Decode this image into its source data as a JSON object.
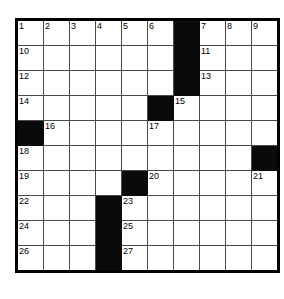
{
  "page": {
    "kind": "crossword-grid",
    "top_text_fragments": {
      "left": "cut-off text line fragment",
      "right": "cut-off text line fragment"
    }
  },
  "grid": {
    "columns": 10,
    "rows": 10,
    "colors": {
      "block": "#0a0a0a",
      "cell": "#ffffff",
      "rule": "#4a4a4a",
      "outer_border": "#000000"
    },
    "cells": [
      [
        {
          "block": false,
          "num": "1"
        },
        {
          "block": false,
          "num": "2"
        },
        {
          "block": false,
          "num": "3"
        },
        {
          "block": false,
          "num": "4"
        },
        {
          "block": false,
          "num": "5"
        },
        {
          "block": false,
          "num": "6"
        },
        {
          "block": true,
          "num": ""
        },
        {
          "block": false,
          "num": "7"
        },
        {
          "block": false,
          "num": "8"
        },
        {
          "block": false,
          "num": "9"
        }
      ],
      [
        {
          "block": false,
          "num": "10"
        },
        {
          "block": false,
          "num": ""
        },
        {
          "block": false,
          "num": ""
        },
        {
          "block": false,
          "num": ""
        },
        {
          "block": false,
          "num": ""
        },
        {
          "block": false,
          "num": ""
        },
        {
          "block": true,
          "num": ""
        },
        {
          "block": false,
          "num": "11"
        },
        {
          "block": false,
          "num": ""
        },
        {
          "block": false,
          "num": ""
        }
      ],
      [
        {
          "block": false,
          "num": "12"
        },
        {
          "block": false,
          "num": ""
        },
        {
          "block": false,
          "num": ""
        },
        {
          "block": false,
          "num": ""
        },
        {
          "block": false,
          "num": ""
        },
        {
          "block": false,
          "num": ""
        },
        {
          "block": true,
          "num": ""
        },
        {
          "block": false,
          "num": "13"
        },
        {
          "block": false,
          "num": ""
        },
        {
          "block": false,
          "num": ""
        }
      ],
      [
        {
          "block": false,
          "num": "14"
        },
        {
          "block": false,
          "num": ""
        },
        {
          "block": false,
          "num": ""
        },
        {
          "block": false,
          "num": ""
        },
        {
          "block": false,
          "num": ""
        },
        {
          "block": true,
          "num": ""
        },
        {
          "block": false,
          "num": "15"
        },
        {
          "block": false,
          "num": ""
        },
        {
          "block": false,
          "num": ""
        },
        {
          "block": false,
          "num": ""
        }
      ],
      [
        {
          "block": true,
          "num": ""
        },
        {
          "block": false,
          "num": "16"
        },
        {
          "block": false,
          "num": ""
        },
        {
          "block": false,
          "num": ""
        },
        {
          "block": false,
          "num": ""
        },
        {
          "block": false,
          "num": "17"
        },
        {
          "block": false,
          "num": ""
        },
        {
          "block": false,
          "num": ""
        },
        {
          "block": false,
          "num": ""
        },
        {
          "block": false,
          "num": ""
        }
      ],
      [
        {
          "block": false,
          "num": "18"
        },
        {
          "block": false,
          "num": ""
        },
        {
          "block": false,
          "num": ""
        },
        {
          "block": false,
          "num": ""
        },
        {
          "block": false,
          "num": ""
        },
        {
          "block": false,
          "num": ""
        },
        {
          "block": false,
          "num": ""
        },
        {
          "block": false,
          "num": ""
        },
        {
          "block": false,
          "num": ""
        },
        {
          "block": true,
          "num": ""
        }
      ],
      [
        {
          "block": false,
          "num": "19"
        },
        {
          "block": false,
          "num": ""
        },
        {
          "block": false,
          "num": ""
        },
        {
          "block": false,
          "num": ""
        },
        {
          "block": true,
          "num": ""
        },
        {
          "block": false,
          "num": "20"
        },
        {
          "block": false,
          "num": ""
        },
        {
          "block": false,
          "num": ""
        },
        {
          "block": false,
          "num": ""
        },
        {
          "block": false,
          "num": "21"
        }
      ],
      [
        {
          "block": false,
          "num": "22"
        },
        {
          "block": false,
          "num": ""
        },
        {
          "block": false,
          "num": ""
        },
        {
          "block": true,
          "num": ""
        },
        {
          "block": false,
          "num": "23"
        },
        {
          "block": false,
          "num": ""
        },
        {
          "block": false,
          "num": ""
        },
        {
          "block": false,
          "num": ""
        },
        {
          "block": false,
          "num": ""
        },
        {
          "block": false,
          "num": ""
        }
      ],
      [
        {
          "block": false,
          "num": "24"
        },
        {
          "block": false,
          "num": ""
        },
        {
          "block": false,
          "num": ""
        },
        {
          "block": true,
          "num": ""
        },
        {
          "block": false,
          "num": "25"
        },
        {
          "block": false,
          "num": ""
        },
        {
          "block": false,
          "num": ""
        },
        {
          "block": false,
          "num": ""
        },
        {
          "block": false,
          "num": ""
        },
        {
          "block": false,
          "num": ""
        }
      ],
      [
        {
          "block": false,
          "num": "26"
        },
        {
          "block": false,
          "num": ""
        },
        {
          "block": false,
          "num": ""
        },
        {
          "block": true,
          "num": ""
        },
        {
          "block": false,
          "num": "27"
        },
        {
          "block": false,
          "num": ""
        },
        {
          "block": false,
          "num": ""
        },
        {
          "block": false,
          "num": ""
        },
        {
          "block": false,
          "num": ""
        },
        {
          "block": false,
          "num": ""
        }
      ]
    ]
  }
}
